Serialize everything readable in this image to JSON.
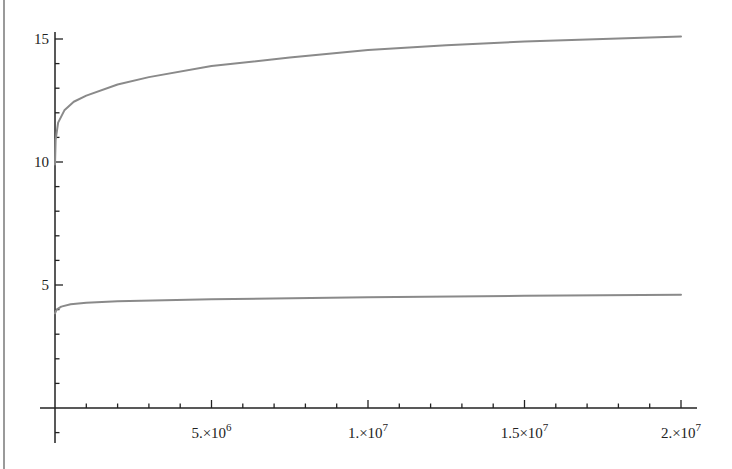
{
  "chart_data": {
    "type": "line",
    "title": "",
    "xlabel": "",
    "ylabel": "",
    "xlim": [
      0,
      20000000
    ],
    "ylim": [
      -1,
      15.3
    ],
    "grid": false,
    "legend": null,
    "x_ticks": [
      {
        "value": 5000000,
        "label": "5.×10",
        "exp": "6"
      },
      {
        "value": 10000000,
        "label": "1.×10",
        "exp": "7"
      },
      {
        "value": 15000000,
        "label": "1.5×10",
        "exp": "7"
      },
      {
        "value": 20000000,
        "label": "2.×10",
        "exp": "7"
      }
    ],
    "y_ticks": [
      {
        "value": 5,
        "label": "5"
      },
      {
        "value": 10,
        "label": "10"
      },
      {
        "value": 15,
        "label": "15"
      }
    ],
    "x_minor_step": 1000000,
    "y_minor_step": 1,
    "series": [
      {
        "name": "upper",
        "color": "#8a8a8a",
        "x": [
          0,
          20000,
          100000,
          300000,
          600000,
          1000000,
          2000000,
          3000000,
          5000000,
          7500000,
          10000000,
          12500000,
          15000000,
          17500000,
          20000000
        ],
        "y": [
          9.9,
          10.9,
          11.6,
          12.1,
          12.45,
          12.7,
          13.15,
          13.45,
          13.9,
          14.25,
          14.55,
          14.75,
          14.9,
          15.0,
          15.1
        ]
      },
      {
        "name": "lower",
        "color": "#8a8a8a",
        "x": [
          0,
          50000,
          200000,
          500000,
          1000000,
          2000000,
          5000000,
          10000000,
          15000000,
          20000000
        ],
        "y": [
          3.85,
          4.0,
          4.12,
          4.22,
          4.28,
          4.34,
          4.42,
          4.5,
          4.56,
          4.6
        ]
      }
    ]
  }
}
